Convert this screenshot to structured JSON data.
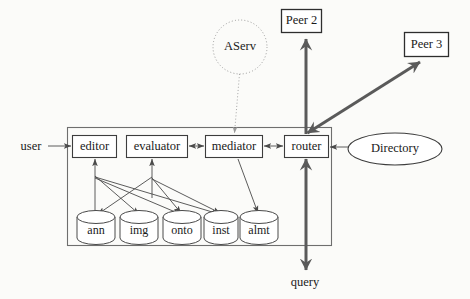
{
  "diagram": {
    "container": {
      "name": "peer-container"
    },
    "internal_nodes": [
      {
        "id": "editor",
        "label": "editor",
        "x": 72,
        "y": 135,
        "w": 45,
        "h": 22
      },
      {
        "id": "evaluator",
        "label": "evaluator",
        "x": 126,
        "y": 135,
        "w": 62,
        "h": 22
      },
      {
        "id": "mediator",
        "label": "mediator",
        "x": 205,
        "y": 135,
        "w": 58,
        "h": 22
      },
      {
        "id": "router",
        "label": "router",
        "x": 284,
        "y": 135,
        "w": 45,
        "h": 22
      }
    ],
    "datastores": [
      {
        "id": "ann",
        "label": "ann",
        "cx": 96,
        "cy": 228
      },
      {
        "id": "img",
        "label": "img",
        "cx": 139,
        "cy": 228
      },
      {
        "id": "onto",
        "label": "onto",
        "cx": 182,
        "cy": 228
      },
      {
        "id": "inst",
        "label": "inst",
        "cx": 221,
        "cy": 228
      },
      {
        "id": "almt",
        "label": "almt",
        "cx": 259,
        "cy": 228
      }
    ],
    "external_nodes": [
      {
        "id": "peer2",
        "label": "Peer 2",
        "shape": "box",
        "x": 281,
        "y": 9,
        "w": 41,
        "h": 24
      },
      {
        "id": "peer3",
        "label": "Peer 3",
        "shape": "box",
        "x": 404,
        "y": 32,
        "w": 45,
        "h": 25
      },
      {
        "id": "directory",
        "label": "Directory",
        "shape": "ellipse",
        "cx": 395,
        "cy": 149,
        "rx": 47,
        "ry": 16
      },
      {
        "id": "aserv",
        "label": "AServ",
        "shape": "dotted-circle",
        "cx": 240,
        "cy": 47,
        "r": 27
      }
    ],
    "edge_labels": [
      {
        "id": "user",
        "label": "user",
        "x": 31,
        "y": 147
      },
      {
        "id": "query",
        "label": "query",
        "x": 305,
        "y": 283
      }
    ],
    "colors": {
      "background": "#fbfbf9",
      "stroke_thin": "#4a4a4a",
      "stroke_thick": "#5a5a5a",
      "stroke_dotted": "#9a9a9a",
      "container": "#6e6e6e",
      "text": "#1a1a1a",
      "node_fill": "#ffffff"
    }
  }
}
